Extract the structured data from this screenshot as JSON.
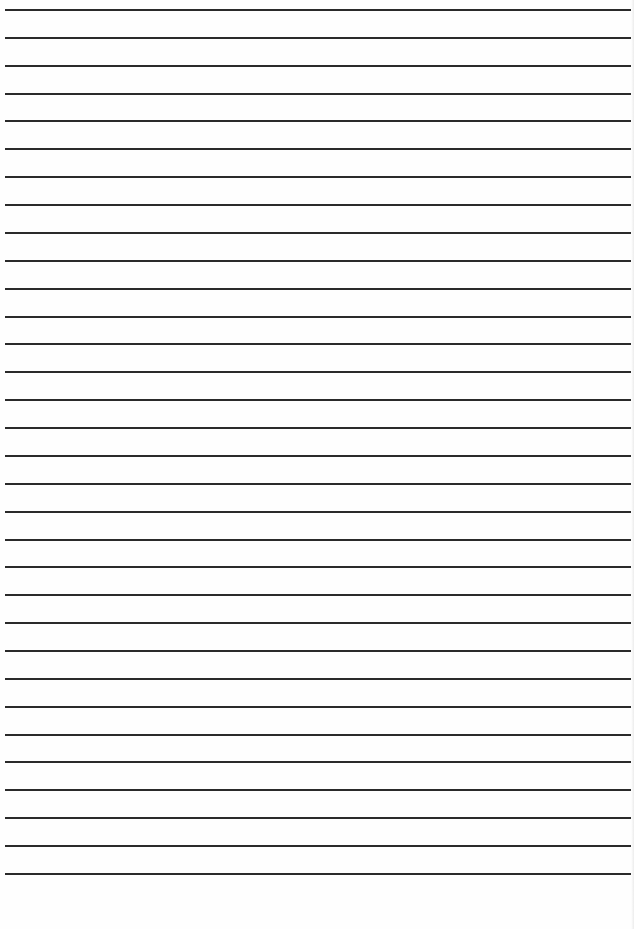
{
  "page": {
    "type": "lined-paper",
    "background_color": "#fefefe",
    "line_color": "#2a2a2a",
    "line_count": 32,
    "first_line_y": 9,
    "line_spacing": 27.87,
    "line_left": 5,
    "line_width": 626,
    "line_thickness": 2
  }
}
